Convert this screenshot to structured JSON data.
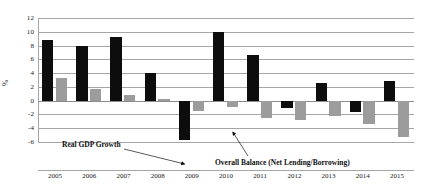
{
  "chart_data": {
    "type": "bar",
    "title": "",
    "subtitle": "",
    "xlabel": "",
    "ylabel": "%",
    "ylim": [
      -6,
      12
    ],
    "ytick_step": 2,
    "yticks": [
      "12",
      "10",
      "8",
      "6",
      "4",
      "2",
      "0",
      "-2",
      "-4",
      "-6"
    ],
    "grid": true,
    "legend": "none",
    "categories": [
      "2005",
      "2006",
      "2007",
      "2008",
      "2009",
      "2010",
      "2011",
      "2012",
      "2013",
      "2014",
      "2015"
    ],
    "series": [
      {
        "name": "Real GDP Growth",
        "color": "#0d0d0d",
        "values": [
          8.8,
          8.0,
          9.3,
          4.0,
          -5.7,
          10.0,
          6.7,
          -1.0,
          2.5,
          -1.7,
          2.8
        ]
      },
      {
        "name": "Overall Balance (Net Lending/Borrowing)",
        "color": "#9c9c9c",
        "values": [
          3.3,
          1.7,
          0.8,
          0.3,
          -1.5,
          -0.9,
          -2.5,
          -2.8,
          -2.2,
          -3.4,
          -5.3
        ]
      }
    ],
    "annotations": [
      {
        "id": "gdp",
        "text": "Real GDP Growth",
        "points_to_series": "Real GDP Growth",
        "points_to_category": "2009"
      },
      {
        "id": "balance",
        "text": "Overall Balance (Net Lending/Borrowing)",
        "points_to_series": "Overall Balance (Net Lending/Borrowing)",
        "points_to_category": "2010"
      }
    ]
  },
  "axis": {
    "y_label": "%"
  }
}
